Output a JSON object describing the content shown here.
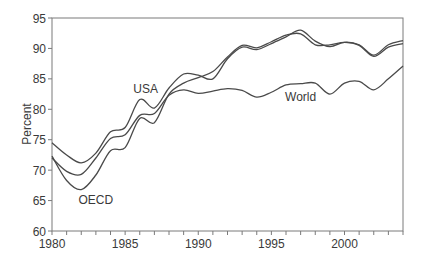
{
  "chart_data": {
    "type": "line",
    "title": "",
    "xlabel": "",
    "ylabel": "Percent",
    "xlim": [
      1980,
      2004
    ],
    "ylim": [
      60,
      95
    ],
    "x_ticks": [
      1980,
      1985,
      1990,
      1995,
      2000
    ],
    "y_ticks": [
      60,
      65,
      70,
      75,
      80,
      85,
      90,
      95
    ],
    "grid": false,
    "legend": "inline labels",
    "x": [
      1980,
      1981,
      1982,
      1983,
      1984,
      1985,
      1986,
      1987,
      1988,
      1989,
      1990,
      1991,
      1992,
      1993,
      1994,
      1995,
      1996,
      1997,
      1998,
      1999,
      2000,
      2001,
      2002,
      2003,
      2004
    ],
    "series": [
      {
        "name": "USA",
        "values": [
          74.5,
          72.5,
          71.2,
          72.8,
          76.3,
          77.0,
          81.6,
          80.2,
          83.5,
          85.8,
          85.6,
          85.0,
          88.3,
          90.2,
          89.8,
          90.8,
          91.9,
          93.0,
          91.2,
          90.3,
          91.0,
          90.6,
          88.9,
          90.6,
          91.3
        ]
      },
      {
        "name": "OECD",
        "values": [
          72.3,
          68.3,
          66.8,
          69.2,
          73.2,
          73.7,
          78.5,
          77.8,
          82.5,
          84.3,
          85.2,
          86.2,
          88.6,
          90.5,
          90.1,
          91.1,
          92.2,
          92.4,
          90.6,
          90.6,
          91.0,
          90.5,
          88.7,
          90.2,
          90.8
        ]
      },
      {
        "name": "World",
        "values": [
          72.0,
          69.8,
          69.3,
          72.0,
          75.2,
          75.8,
          79.0,
          79.3,
          82.3,
          83.2,
          82.6,
          83.0,
          83.4,
          83.1,
          82.0,
          82.8,
          84.0,
          84.2,
          84.3,
          82.5,
          84.3,
          84.6,
          83.2,
          85.0,
          87.1
        ]
      }
    ],
    "annotations": [
      {
        "text": "USA",
        "x": 1986.4,
        "y": 82.6
      },
      {
        "text": "OECD",
        "x": 1983.0,
        "y": 64.4
      },
      {
        "text": "World",
        "x": 1997.0,
        "y": 81.3
      }
    ]
  },
  "labels": {
    "ylabel": "Percent",
    "usa": "USA",
    "oecd": "OECD",
    "world": "World"
  },
  "colors": {
    "line": "#4a4a4a",
    "axis": "#7a7a7a",
    "text": "#3a3a3a"
  }
}
